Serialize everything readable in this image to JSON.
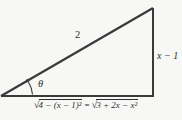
{
  "figure": {
    "line_color": "#3a3a3a",
    "background_color": "#f7f7f5",
    "hypotenuse_label": "2",
    "vertical_side_label": "x − 1",
    "angle_label": "θ"
  },
  "equation": {
    "radical_sign": "√",
    "lhs_radicand": "4 − (x − 1)²",
    "equals_sign": "=",
    "rhs_radicand": "3 + 2x − x²"
  }
}
